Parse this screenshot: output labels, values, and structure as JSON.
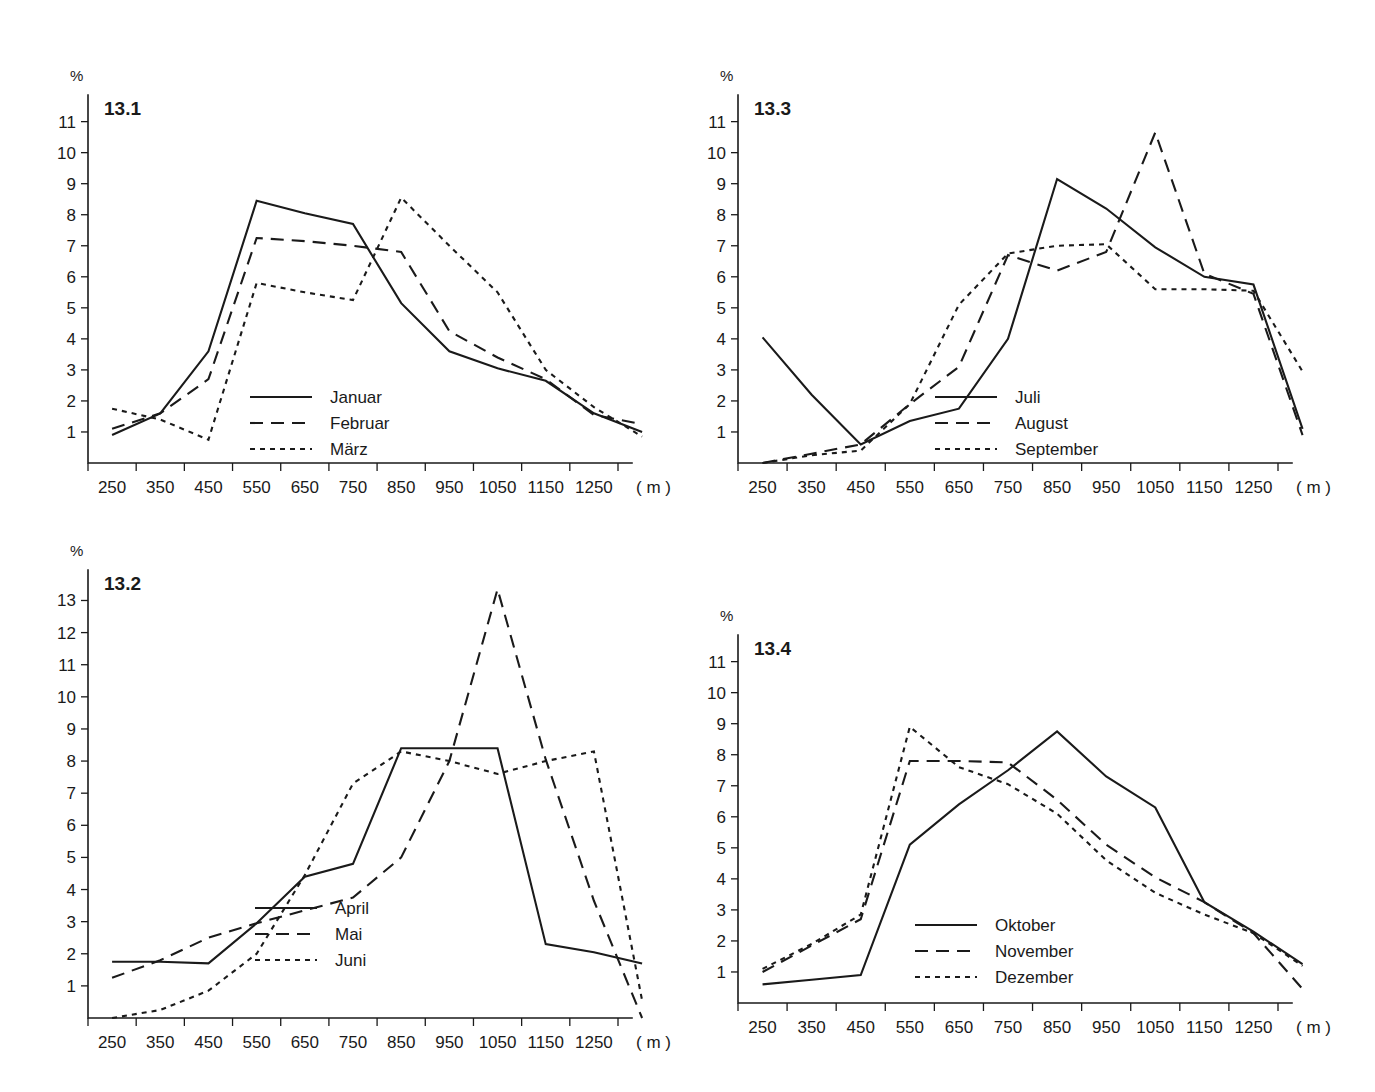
{
  "page": {
    "background": "#ffffff",
    "ink_color": "#1a1a1a"
  },
  "panels": [
    {
      "id": "13.1",
      "y_unit": "%",
      "x_unit": "( m )",
      "legend": [
        {
          "label": "Januar",
          "style": "solid"
        },
        {
          "label": "Februar",
          "style": "dashed"
        },
        {
          "label": "März",
          "style": "dotted"
        }
      ]
    },
    {
      "id": "13.2",
      "y_unit": "%",
      "x_unit": "( m )",
      "legend": [
        {
          "label": "April",
          "style": "solid"
        },
        {
          "label": "Mai",
          "style": "dashed"
        },
        {
          "label": "Juni",
          "style": "dotted"
        }
      ]
    },
    {
      "id": "13.3",
      "y_unit": "%",
      "x_unit": "( m )",
      "legend": [
        {
          "label": "Juli",
          "style": "solid"
        },
        {
          "label": "August",
          "style": "dashed"
        },
        {
          "label": "September",
          "style": "dotted"
        }
      ]
    },
    {
      "id": "13.4",
      "y_unit": "%",
      "x_unit": "( m )",
      "legend": [
        {
          "label": "Oktober",
          "style": "solid"
        },
        {
          "label": "November",
          "style": "dashed"
        },
        {
          "label": "Dezember",
          "style": "dotted"
        }
      ]
    }
  ],
  "chart_data": [
    {
      "type": "line",
      "title": "13.1",
      "xlabel": "( m )",
      "ylabel": "%",
      "x": [
        250,
        350,
        450,
        550,
        650,
        750,
        850,
        950,
        1050,
        1150,
        1250,
        1350
      ],
      "categories": [
        "250",
        "350",
        "450",
        "550",
        "650",
        "750",
        "850",
        "950",
        "1050",
        "1150",
        "1250"
      ],
      "xlim": [
        200,
        1300
      ],
      "ylim": [
        0,
        11.6
      ],
      "yticks": [
        1,
        2,
        3,
        4,
        5,
        6,
        7,
        8,
        9,
        10,
        11
      ],
      "grid": false,
      "legend_position": "inside-bottom-center",
      "series": [
        {
          "name": "Januar",
          "style": "solid",
          "values": [
            0.9,
            1.6,
            3.6,
            8.45,
            8.05,
            7.7,
            5.15,
            3.6,
            3.05,
            2.65,
            1.6,
            1.0
          ]
        },
        {
          "name": "Februar",
          "style": "dashed",
          "values": [
            1.1,
            1.6,
            2.7,
            7.25,
            7.15,
            7.0,
            6.8,
            4.25,
            3.4,
            2.7,
            1.55,
            1.25
          ]
        },
        {
          "name": "März",
          "style": "dotted",
          "values": [
            1.75,
            1.4,
            0.75,
            5.8,
            5.5,
            5.25,
            8.55,
            7.0,
            5.5,
            3.0,
            1.8,
            0.85
          ]
        }
      ]
    },
    {
      "type": "line",
      "title": "13.2",
      "xlabel": "( m )",
      "ylabel": "%",
      "x": [
        250,
        350,
        450,
        550,
        650,
        750,
        850,
        950,
        1050,
        1150,
        1250,
        1350
      ],
      "categories": [
        "250",
        "350",
        "450",
        "550",
        "650",
        "750",
        "850",
        "950",
        "1050",
        "1150",
        "1250"
      ],
      "xlim": [
        200,
        1300
      ],
      "ylim": [
        0,
        13.7
      ],
      "yticks": [
        1,
        2,
        3,
        4,
        5,
        6,
        7,
        8,
        9,
        10,
        11,
        12,
        13
      ],
      "grid": false,
      "legend_position": "inside-bottom-center",
      "series": [
        {
          "name": "April",
          "style": "solid",
          "values": [
            1.75,
            1.75,
            1.7,
            2.95,
            4.4,
            4.8,
            8.4,
            8.4,
            8.4,
            2.3,
            2.05,
            1.7
          ]
        },
        {
          "name": "Mai",
          "style": "dashed",
          "values": [
            1.25,
            1.8,
            2.5,
            2.95,
            3.35,
            3.75,
            5.0,
            8.0,
            13.35,
            8.05,
            3.65,
            0.0
          ]
        },
        {
          "name": "Juni",
          "style": "dotted",
          "values": [
            0.0,
            0.25,
            0.85,
            2.0,
            4.45,
            7.3,
            8.3,
            8.0,
            7.6,
            8.0,
            8.3,
            0.55
          ]
        }
      ]
    },
    {
      "type": "line",
      "title": "13.3",
      "xlabel": "( m )",
      "ylabel": "%",
      "x": [
        250,
        350,
        450,
        550,
        650,
        750,
        850,
        950,
        1050,
        1150,
        1250,
        1350
      ],
      "categories": [
        "250",
        "350",
        "450",
        "550",
        "650",
        "750",
        "850",
        "950",
        "1050",
        "1150",
        "1250"
      ],
      "xlim": [
        200,
        1300
      ],
      "ylim": [
        0,
        11.6
      ],
      "yticks": [
        1,
        2,
        3,
        4,
        5,
        6,
        7,
        8,
        9,
        10,
        11
      ],
      "grid": false,
      "legend_position": "inside-bottom-center",
      "series": [
        {
          "name": "Juli",
          "style": "solid",
          "values": [
            4.05,
            2.2,
            0.6,
            1.35,
            1.75,
            4.0,
            9.15,
            8.2,
            6.95,
            6.0,
            5.75,
            1.1
          ]
        },
        {
          "name": "August",
          "style": "dashed",
          "values": [
            0.0,
            0.3,
            0.6,
            1.9,
            3.1,
            6.7,
            6.2,
            6.8,
            10.65,
            6.1,
            5.45,
            0.9
          ]
        },
        {
          "name": "September",
          "style": "dotted",
          "values": [
            0.0,
            0.25,
            0.4,
            1.9,
            5.1,
            6.75,
            7.0,
            7.05,
            5.6,
            5.6,
            5.55,
            2.95
          ]
        }
      ]
    },
    {
      "type": "line",
      "title": "13.4",
      "xlabel": "( m )",
      "ylabel": "%",
      "x": [
        250,
        350,
        450,
        550,
        650,
        750,
        850,
        950,
        1050,
        1150,
        1250,
        1350
      ],
      "categories": [
        "250",
        "350",
        "450",
        "550",
        "650",
        "750",
        "850",
        "950",
        "1050",
        "1150",
        "1250"
      ],
      "xlim": [
        200,
        1300
      ],
      "ylim": [
        0,
        11.6
      ],
      "yticks": [
        1,
        2,
        3,
        4,
        5,
        6,
        7,
        8,
        9,
        10,
        11
      ],
      "grid": false,
      "legend_position": "inside-bottom-center",
      "series": [
        {
          "name": "Oktober",
          "style": "solid",
          "values": [
            0.6,
            0.75,
            0.9,
            5.1,
            6.4,
            7.5,
            8.75,
            7.3,
            6.3,
            3.25,
            2.3,
            1.25
          ]
        },
        {
          "name": "November",
          "style": "dashed",
          "values": [
            1.0,
            1.85,
            2.7,
            7.8,
            7.8,
            7.75,
            6.55,
            5.1,
            4.05,
            3.25,
            2.25,
            0.45
          ]
        },
        {
          "name": "Dezember",
          "style": "dotted",
          "values": [
            1.1,
            1.9,
            2.85,
            8.9,
            7.6,
            7.05,
            6.1,
            4.6,
            3.55,
            2.85,
            2.25,
            1.2
          ]
        }
      ]
    }
  ]
}
